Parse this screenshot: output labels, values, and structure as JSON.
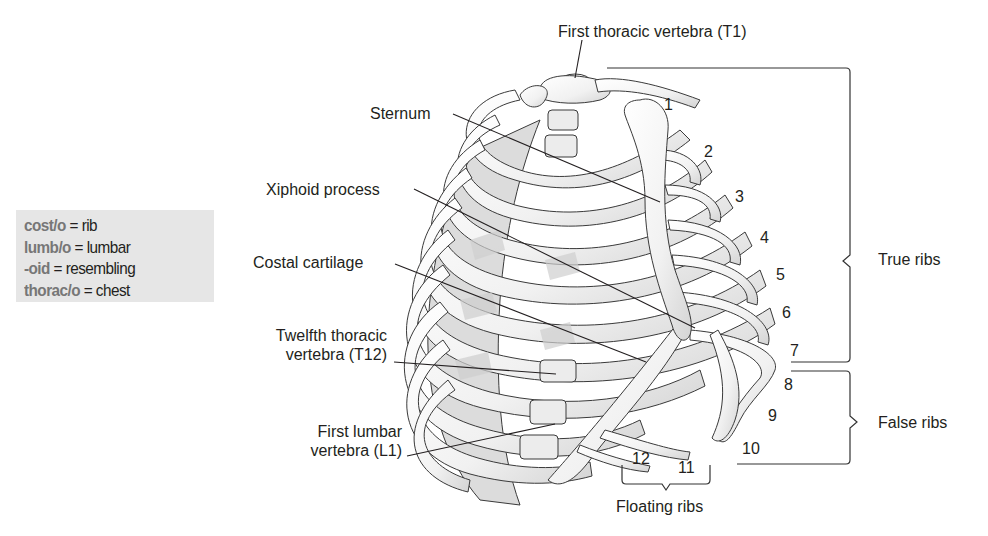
{
  "vocab_box": {
    "background": "#e6e6e6",
    "term_color": "#777777",
    "items": [
      {
        "term": "cost/o",
        "sep": " = ",
        "meaning": "rib"
      },
      {
        "term": "lumb/o",
        "sep": " = ",
        "meaning": "lumbar"
      },
      {
        "term": "-oid",
        "sep": " = ",
        "meaning": "resembling"
      },
      {
        "term": "thorac/o",
        "sep": " = ",
        "meaning": "chest"
      }
    ]
  },
  "labels": {
    "t1": "First thoracic vertebra (T1)",
    "sternum": "Sternum",
    "xiphoid": "Xiphoid process",
    "costal_cartilage": "Costal cartilage",
    "t12_line1": "Twelfth thoracic",
    "t12_line2": "vertebra (T12)",
    "l1_line1": "First lumbar",
    "l1_line2": "vertebra (L1)"
  },
  "groups": {
    "true_ribs": "True ribs",
    "false_ribs": "False ribs",
    "floating_ribs": "Floating ribs"
  },
  "rib_numbers": [
    "1",
    "2",
    "3",
    "4",
    "5",
    "6",
    "7",
    "8",
    "9",
    "10",
    "11",
    "12"
  ]
}
